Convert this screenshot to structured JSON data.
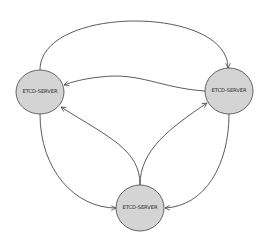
{
  "diagram": {
    "type": "directed-graph",
    "colors": {
      "node_fill": "#d4d4d4",
      "node_stroke": "#555555",
      "edge": "#4a4a4a",
      "background": "#ffffff"
    },
    "nodes": [
      {
        "id": "left",
        "label": "ETCD-SERVER"
      },
      {
        "id": "right",
        "label": "ETCD-SERVER"
      },
      {
        "id": "bottom",
        "label": "ETCD-SERVER"
      }
    ],
    "edges": [
      {
        "from": "left",
        "to": "right",
        "route": "top-arc"
      },
      {
        "from": "right",
        "to": "left",
        "route": "middle"
      },
      {
        "from": "bottom",
        "to": "left",
        "route": "inner"
      },
      {
        "from": "bottom",
        "to": "right",
        "route": "inner"
      },
      {
        "from": "left",
        "to": "bottom",
        "route": "outer"
      },
      {
        "from": "right",
        "to": "bottom",
        "route": "outer"
      }
    ]
  }
}
